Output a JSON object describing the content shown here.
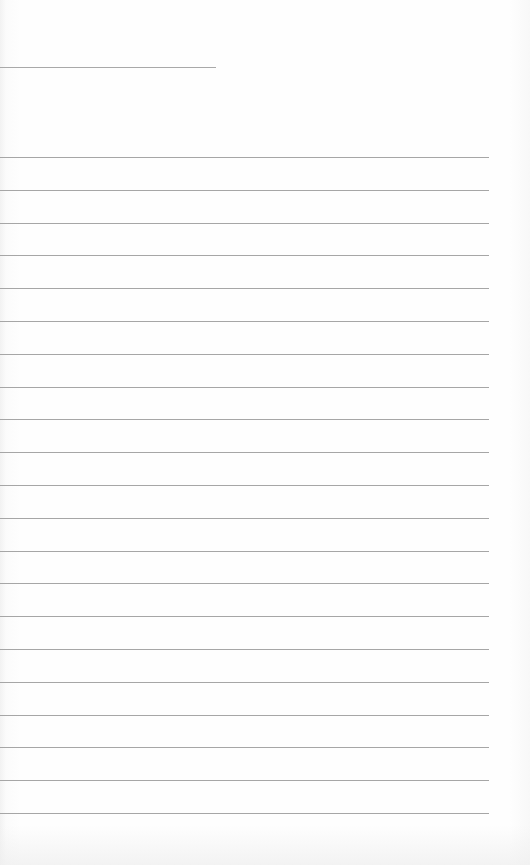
{
  "document": {
    "type": "lined-paper",
    "header_line": {
      "top": 67,
      "width": 216
    },
    "rules": {
      "count": 21,
      "first_top": 157,
      "spacing": 32.8,
      "width": 489
    },
    "colors": {
      "paper": "#fdfdfd",
      "line": "#a6a6a6"
    }
  }
}
